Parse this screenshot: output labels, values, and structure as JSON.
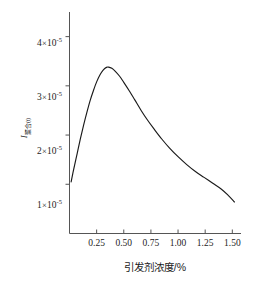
{
  "chart_data": {
    "type": "line",
    "title": "",
    "xlabel": "引发剂浓度/%",
    "ylabel_main": "I",
    "ylabel_sub": "聚合(t)",
    "xlim": [
      0.0,
      1.58
    ],
    "ylim": [
      0.0,
      4.5e-05
    ],
    "grid": false,
    "legend": null,
    "xticks": [
      0.25,
      0.5,
      0.75,
      1.0,
      1.25,
      1.5
    ],
    "xtick_labels": [
      "0.25",
      "0.50",
      "0.75",
      "1.00",
      "1.25",
      "1.50"
    ],
    "yticks": [
      1e-05,
      2e-05,
      3e-05,
      4e-05
    ],
    "ytick_labels": [
      {
        "mantissa": "1",
        "times": "×",
        "base": "10",
        "exponent": "-5"
      },
      {
        "mantissa": "2",
        "times": "×",
        "base": "10",
        "exponent": "-5"
      },
      {
        "mantissa": "3",
        "times": "×",
        "base": "10",
        "exponent": "-5"
      },
      {
        "mantissa": "4",
        "times": "×",
        "base": "10",
        "exponent": "-5"
      }
    ],
    "series": [
      {
        "name": "",
        "color": "#1a1a1a",
        "x": [
          0.015,
          0.04,
          0.07,
          0.1,
          0.13,
          0.16,
          0.19,
          0.22,
          0.25,
          0.28,
          0.31,
          0.34,
          0.36,
          0.39,
          0.42,
          0.46,
          0.5,
          0.55,
          0.6,
          0.66,
          0.72,
          0.78,
          0.85,
          0.92,
          1.0,
          1.08,
          1.16,
          1.24,
          1.32,
          1.4,
          1.46,
          1.52
        ],
        "y": [
          1.05e-05,
          1.32e-05,
          1.62e-05,
          1.92e-05,
          2.2e-05,
          2.46e-05,
          2.7e-05,
          2.9e-05,
          3.08e-05,
          3.22e-05,
          3.32e-05,
          3.375e-05,
          3.38e-05,
          3.355e-05,
          3.3e-05,
          3.2e-05,
          3.07e-05,
          2.9e-05,
          2.72e-05,
          2.5e-05,
          2.3e-05,
          2.12e-05,
          1.92e-05,
          1.74e-05,
          1.56e-05,
          1.4e-05,
          1.26e-05,
          1.14e-05,
          1.02e-05,
          9e-06,
          7.8e-06,
          6.4e-06
        ]
      }
    ],
    "peak": {
      "x": 0.36,
      "y": 3.38e-05
    },
    "axis_color": "#4a4a4a"
  }
}
